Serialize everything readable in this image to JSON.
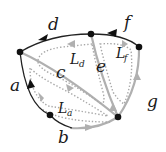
{
  "diagram": {
    "type": "ribbon-graph-with-boundary-loops",
    "vertices": [
      {
        "id": "v_left",
        "x": 20,
        "y": 52
      },
      {
        "id": "v_top",
        "x": 91,
        "y": 34
      },
      {
        "id": "v_right",
        "x": 139,
        "y": 47
      },
      {
        "id": "v_bottom_left",
        "x": 50,
        "y": 115
      },
      {
        "id": "v_bottom_right",
        "x": 118,
        "y": 117
      }
    ],
    "edges": [
      {
        "label": "a",
        "style": "black",
        "from": "v_bottom_left",
        "to": "v_left",
        "arrow": true
      },
      {
        "label": "b",
        "style": "black-to-gray",
        "from": "v_bottom_left",
        "to": "v_bottom_right",
        "arrow": true
      },
      {
        "label": "c",
        "style": "gray",
        "from": "v_left",
        "to": "v_bottom_right",
        "arrow": true
      },
      {
        "label": "d",
        "style": "black",
        "from": "v_left",
        "to": "v_top",
        "arrow": true
      },
      {
        "label": "e",
        "style": "gray",
        "from": "v_top",
        "to": "v_bottom_right",
        "arrow": false
      },
      {
        "label": "f",
        "style": "black",
        "from": "v_right",
        "to": "v_top",
        "arrow": true
      },
      {
        "label": "g",
        "style": "gray",
        "from": "v_bottom_right",
        "to": "v_right",
        "arrow": true
      }
    ],
    "labels": {
      "a": "a",
      "b": "b",
      "c": "c",
      "d": "d",
      "e": "e",
      "f": "f",
      "g": "g"
    },
    "loops": [
      {
        "name": "L",
        "subscript": "d"
      },
      {
        "name": "L",
        "subscript": "f"
      },
      {
        "name": "L",
        "subscript": "a"
      }
    ],
    "colors": {
      "black_edge": "#222222",
      "gray_edge": "#b0b0b0",
      "dotted_loop": "#a8a8a8",
      "vertex": "#111111"
    }
  }
}
